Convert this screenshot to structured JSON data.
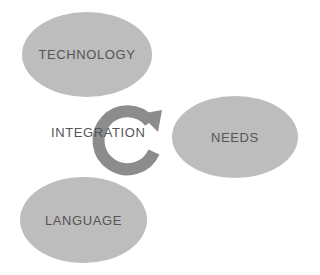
{
  "diagram": {
    "nodes": [
      {
        "id": "technology",
        "label": "TECHNOLOGY"
      },
      {
        "id": "needs",
        "label": "NEEDS"
      },
      {
        "id": "language",
        "label": "LANGUAGE"
      }
    ],
    "center": {
      "label": "INTEGRATION",
      "icon": "circular-arrow-icon"
    },
    "colors": {
      "node_fill": "#bdbdbd",
      "arrow": "#8c8c8c",
      "text": "#555555"
    }
  }
}
